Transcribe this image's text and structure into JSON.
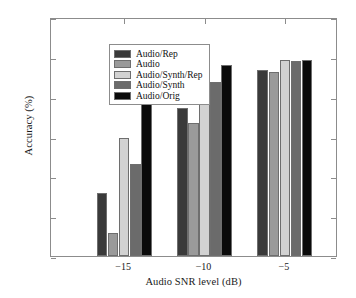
{
  "chart_data": {
    "type": "bar",
    "title": "",
    "xlabel": "Audio SNR level (dB)",
    "ylabel": "Accuracy (%)",
    "categories": [
      "−15",
      "−10",
      "−5"
    ],
    "xtick_labels": [
      "−15",
      "−10",
      "−5"
    ],
    "ytick_labels": [
      "0",
      "20",
      "40",
      "60",
      "80",
      "100",
      "120"
    ],
    "ytick_values": [
      0,
      20,
      40,
      60,
      80,
      100,
      120
    ],
    "ylim": [
      0,
      120
    ],
    "grid": false,
    "legend_position": "upper left",
    "series": [
      {
        "name": "Audio/Rep",
        "color": "#3a3a3a",
        "values": [
          31.5,
          74.5,
          93.5
        ]
      },
      {
        "name": "Audio",
        "color": "#9a9a9a",
        "values": [
          11.5,
          67.0,
          92.5
        ]
      },
      {
        "name": "Audio/Synth/Rep",
        "color": "#d2d2d2",
        "values": [
          59.5,
          90.5,
          98.5
        ]
      },
      {
        "name": "Audio/Synth",
        "color": "#6b6b6b",
        "values": [
          46.0,
          87.5,
          98.0
        ]
      },
      {
        "name": "Audio/Orig",
        "color": "#0a0a0a",
        "values": [
          86.5,
          96.0,
          98.5
        ]
      }
    ]
  },
  "axes": {
    "frame_color": "#8c8c8c",
    "background": "#ffffff"
  }
}
